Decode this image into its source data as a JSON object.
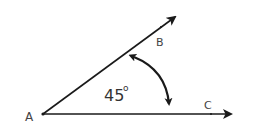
{
  "diagram": {
    "title": "",
    "type": "angle",
    "vertex": {
      "label": "A",
      "x": 43,
      "y": 114
    },
    "rays": [
      {
        "label": "B",
        "end_x": 176,
        "end_y": 16,
        "label_x": 156,
        "label_y": 46
      },
      {
        "label": "C",
        "end_x": 232,
        "end_y": 114,
        "label_x": 204,
        "label_y": 109
      }
    ],
    "angle": {
      "value": "45",
      "unit": "o",
      "text": "45"
    },
    "labels": {
      "A": "A",
      "B": "B",
      "C": "C",
      "angle_value": "45",
      "degree_mark": "o"
    },
    "colors": {
      "line": "#1a1a1a",
      "label": "#444444",
      "background": "#ffffff"
    }
  }
}
